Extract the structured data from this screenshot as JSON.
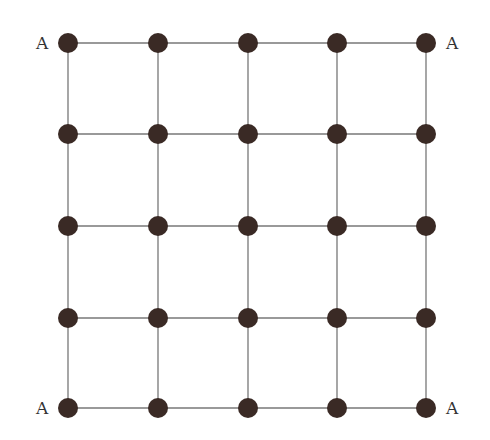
{
  "diagram": {
    "type": "grid-graph",
    "rows": 5,
    "cols": 5,
    "node_color": "#3a2a25",
    "edge_color": "#777777",
    "corner_labels": {
      "top_left": "A",
      "top_right": "A",
      "bottom_left": "A",
      "bottom_right": "A"
    }
  }
}
